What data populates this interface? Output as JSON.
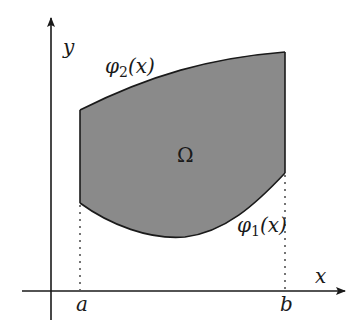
{
  "diagram": {
    "type": "region-between-curves",
    "colors": {
      "region_fill": "#8a8a8a",
      "stroke": "#1a1a1a",
      "background": "#ffffff"
    },
    "axes": {
      "x_label": "x",
      "y_label": "y"
    },
    "bounds": {
      "left_label": "a",
      "right_label": "b"
    },
    "curves": {
      "upper": {
        "name": "φ",
        "subscript": "2",
        "arg": "(x)"
      },
      "lower": {
        "name": "φ",
        "subscript": "1",
        "arg": "(x)"
      }
    },
    "region_label": "Ω"
  }
}
